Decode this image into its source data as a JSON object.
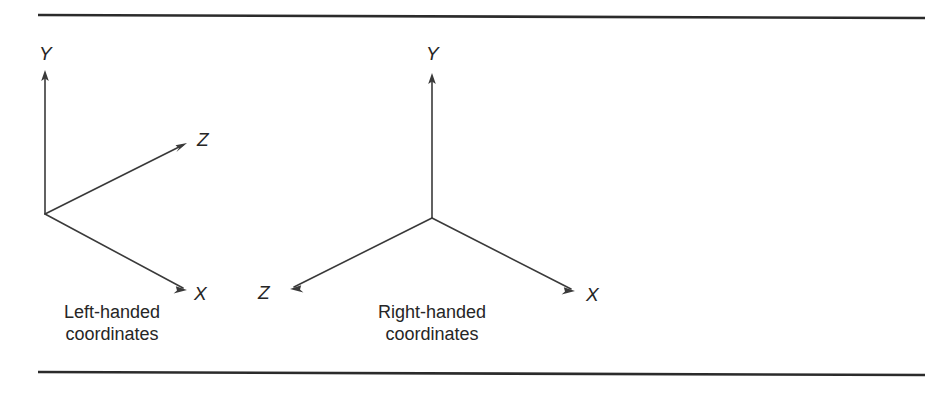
{
  "figure": {
    "background_color": "#ffffff",
    "line_color": "#3a3a3a",
    "rule_color": "#2b2b2b",
    "text_color": "#262626",
    "width": 952,
    "height": 393
  },
  "rules": {
    "top": {
      "x1": 38,
      "y1": 15,
      "x2": 925,
      "y2": 18
    },
    "bottom": {
      "x1": 38,
      "y1": 372,
      "x2": 925,
      "y2": 375
    }
  },
  "systems": [
    {
      "id": "left-handed",
      "origin": {
        "x": 45,
        "y": 214
      },
      "caption": {
        "line1": "Left-handed",
        "line2": "coordinates",
        "cx": 112,
        "y1": 318,
        "y2": 340
      },
      "axes": [
        {
          "name": "Y",
          "label": "Y",
          "label_x": 39,
          "label_y": 60,
          "tip": {
            "x": 45,
            "y": 70
          },
          "angle_deg": 90
        },
        {
          "name": "Z",
          "label": "Z",
          "label_x": 197,
          "label_y": 146,
          "tip": {
            "x": 187,
            "y": 143
          },
          "angle_deg": 27
        },
        {
          "name": "X",
          "label": "X",
          "label_x": 194,
          "label_y": 300,
          "tip": {
            "x": 187,
            "y": 290
          },
          "angle_deg": -27
        }
      ]
    },
    {
      "id": "right-handed",
      "origin": {
        "x": 432,
        "y": 218
      },
      "caption": {
        "line1": "Right-handed",
        "line2": "coordinates",
        "cx": 432,
        "y1": 318,
        "y2": 340
      },
      "axes": [
        {
          "name": "Y",
          "label": "Y",
          "label_x": 426,
          "label_y": 60,
          "tip": {
            "x": 432,
            "y": 73
          },
          "angle_deg": 90
        },
        {
          "name": "Z",
          "label": "Z",
          "label_x": 258,
          "label_y": 299,
          "tip": {
            "x": 290,
            "y": 289
          },
          "angle_deg": 206
        },
        {
          "name": "X",
          "label": "X",
          "label_x": 586,
          "label_y": 301,
          "tip": {
            "x": 575,
            "y": 291
          },
          "angle_deg": -27
        }
      ]
    }
  ]
}
